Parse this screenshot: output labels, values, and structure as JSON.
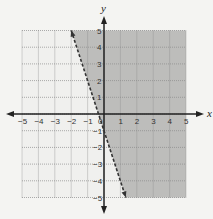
{
  "chart_data": {
    "type": "line",
    "title": "",
    "xlabel": "x",
    "ylabel": "y",
    "xlim": [
      -5,
      5
    ],
    "ylim": [
      -5,
      5
    ],
    "grid": true,
    "x_ticks": [
      "-5",
      "-4",
      "-3",
      "-2",
      "-1",
      "0",
      "1",
      "2",
      "3",
      "4",
      "5"
    ],
    "y_ticks": [
      "5",
      "4",
      "3",
      "2",
      "1",
      "-1",
      "-2",
      "-3",
      "-4",
      "-5"
    ],
    "series": [
      {
        "name": "boundary line y = -3x - 1",
        "style": "dashed",
        "x": [
          -2,
          1.33
        ],
        "y": [
          5,
          -5
        ]
      }
    ],
    "shaded_region": "right of line (y > -3x - 1)",
    "inequality": "y > -3x - 1"
  },
  "colors": {
    "background": "#f4f4f2",
    "grid_bg": "#f0f0ee",
    "shade": "#bdbdbb",
    "grid_line": "#8a8a8a",
    "axis": "#222222"
  }
}
